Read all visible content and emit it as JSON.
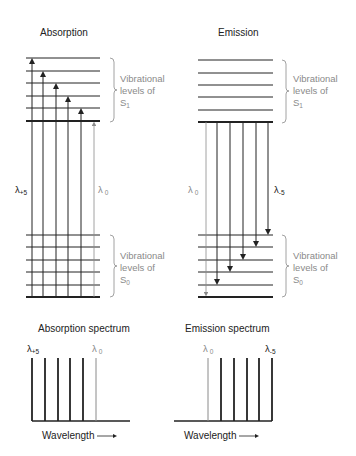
{
  "colors": {
    "dark": "#222222",
    "light": "#8a8a8a",
    "gray_line": "#555555",
    "background": "#ffffff"
  },
  "absorption": {
    "title": "Absorption",
    "s1_label": [
      "Vibrational",
      "levels of",
      "S",
      "1"
    ],
    "s0_label": [
      "Vibrational",
      "levels of",
      "S",
      "0"
    ],
    "lambda_left": {
      "sym": "λ",
      "sub": "+5"
    },
    "lambda_right": {
      "sym": "λ",
      "sub": "0"
    },
    "s1_levels_y": [
      58,
      71,
      83,
      96,
      108,
      121
    ],
    "s0_levels_y": [
      235,
      247,
      260,
      272,
      285,
      297
    ],
    "x_range": [
      26,
      100
    ],
    "arrow_x": [
      32,
      43,
      56,
      68,
      81,
      94
    ],
    "arrow_top_y": [
      58,
      71,
      83,
      96,
      108,
      121
    ]
  },
  "emission": {
    "title": "Emission",
    "s1_label": [
      "Vibrational",
      "levels of",
      "S",
      "1"
    ],
    "s0_label": [
      "Vibrational",
      "levels of",
      "S",
      "0"
    ],
    "lambda_left": {
      "sym": "λ",
      "sub": "0"
    },
    "lambda_right": {
      "sym": "λ",
      "sub": "-5"
    },
    "s1_levels_y": [
      60,
      73,
      85,
      97,
      110,
      122
    ],
    "s0_levels_y": [
      235,
      247,
      260,
      272,
      285,
      297
    ],
    "x_range": [
      198,
      273
    ],
    "arrow_x": [
      206,
      217,
      230,
      243,
      256,
      268
    ],
    "arrow_bottom_y": [
      297,
      285,
      272,
      260,
      247,
      235
    ]
  },
  "absorption_spectrum": {
    "title": "Absorption spectrum",
    "xlabel": "Wavelength",
    "lambda_left": {
      "sym": "λ",
      "sub": "+5"
    },
    "lambda_right": {
      "sym": "λ",
      "sub": "0"
    },
    "bars_x": [
      32,
      45,
      58,
      70,
      83,
      96
    ],
    "bar_top_y": 358,
    "baseline_y": 421,
    "baseline_x": [
      32,
      130
    ]
  },
  "emission_spectrum": {
    "title": "Emission spectrum",
    "xlabel": "Wavelength",
    "lambda_left": {
      "sym": "λ",
      "sub": "0"
    },
    "lambda_right": {
      "sym": "λ",
      "sub": "-5"
    },
    "bars_x": [
      208,
      221,
      234,
      247,
      259,
      272
    ],
    "bar_top_y": 358,
    "baseline_y": 421,
    "baseline_x": [
      174,
      272
    ]
  }
}
